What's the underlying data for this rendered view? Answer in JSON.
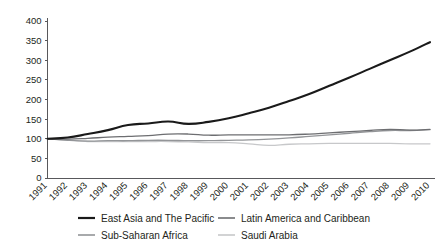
{
  "chart_data": {
    "type": "line",
    "title": "",
    "subtitle": "",
    "xlabel": "",
    "ylabel": "",
    "grid": false,
    "legend_position": "bottom",
    "ylim": [
      0,
      400
    ],
    "yticks": [
      0,
      50,
      100,
      150,
      200,
      250,
      300,
      350,
      400
    ],
    "categories": [
      "1991",
      "1992",
      "1993",
      "1994",
      "1995",
      "1996",
      "1997",
      "1998",
      "1999",
      "2000",
      "2001",
      "2002",
      "2003",
      "2004",
      "2005",
      "2006",
      "2007",
      "2008",
      "2009",
      "2010"
    ],
    "series": [
      {
        "name": "East Asia and The Pacific",
        "color": "#1a1a1a",
        "width": 2.1,
        "values": [
          100,
          103,
          112,
          122,
          135,
          139,
          144,
          138,
          143,
          152,
          165,
          179,
          196,
          214,
          235,
          256,
          278,
          300,
          322,
          346
        ]
      },
      {
        "name": "Latin America and Caribbean",
        "color": "#6d6e71",
        "width": 1.3,
        "values": [
          100,
          99,
          101,
          104,
          106,
          108,
          112,
          112,
          109,
          110,
          110,
          110,
          110,
          112,
          115,
          118,
          121,
          124,
          122,
          124
        ]
      },
      {
        "name": "Sub-Saharan Africa",
        "color": "#939598",
        "width": 1.3,
        "values": [
          100,
          96,
          94,
          95,
          95,
          96,
          96,
          95,
          95,
          96,
          97,
          99,
          102,
          106,
          110,
          114,
          118,
          121,
          121,
          123
        ]
      },
      {
        "name": "Saudi Arabia",
        "color": "#c7c8ca",
        "width": 1.3,
        "values": [
          100,
          97,
          93,
          93,
          93,
          93,
          93,
          92,
          90,
          90,
          87,
          83,
          86,
          87,
          88,
          88,
          88,
          88,
          87,
          87
        ]
      }
    ]
  }
}
